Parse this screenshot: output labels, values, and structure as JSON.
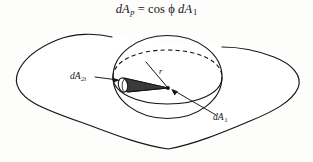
{
  "figure": {
    "caption": {
      "full_text": "dA_p = cos ϕ dA_1",
      "lhs_symbol": "dA",
      "lhs_subscript": "p",
      "equals": "=",
      "cos": "cos",
      "phi": "ϕ",
      "rhs_symbol": "dA",
      "rhs_subscript": "1"
    },
    "labels": {
      "projected_element": {
        "symbol": "dA",
        "subscript": "2i",
        "full_text": "dA2i"
      },
      "source_element": {
        "symbol": "dA",
        "subscript": "1",
        "full_text": "dA1"
      },
      "radius": {
        "symbol": "r",
        "full_text": "r"
      }
    },
    "colors": {
      "ink": "#141414",
      "background": "#fdfdfc",
      "fill_white": "#ffffff",
      "wedge_shade": "#2b2b2b"
    },
    "parts": {
      "enclosing_surface": "irregular-blob-outline",
      "hemisphere": "circle-with-dashed-equator",
      "solid_angle_element": "narrow-cone-wedge",
      "center_point": "apex-dot"
    }
  }
}
